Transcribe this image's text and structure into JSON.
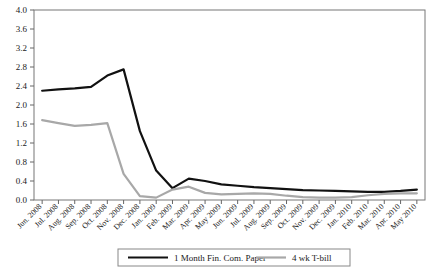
{
  "chart_data": {
    "type": "line",
    "title": "",
    "subtitle": "",
    "xlabel": "",
    "ylabel": "",
    "ylim": [
      0.0,
      4.0
    ],
    "ytick_step": 0.4,
    "grid": false,
    "legend_position": "bottom",
    "yticks": [
      "0.0",
      "0.4",
      "0.8",
      "1.2",
      "1.6",
      "2.0",
      "2.4",
      "2.8",
      "3.2",
      "3.6",
      "4.0"
    ],
    "ytick_values": [
      0.0,
      0.4,
      0.8,
      1.2,
      1.6,
      2.0,
      2.4,
      2.8,
      3.2,
      3.6,
      4.0
    ],
    "categories": [
      "Jun. 2008",
      "Jul. 2008",
      "Aug. 2008",
      "Sep. 2008",
      "Oct. 2008",
      "Nov. 2008",
      "Dec. 2008",
      "Jan. 2009",
      "Feb. 2009",
      "Mar. 2009",
      "Apr. 2009",
      "May 2009",
      "Jun. 2009",
      "Jul. 2009",
      "Aug. 2009",
      "Sep. 2009",
      "Oct. 2009",
      "Nov. 2009",
      "Dec. 2009",
      "Jan. 2010",
      "Feb. 2010",
      "Mar. 2010",
      "Apr. 2010",
      "May 2010"
    ],
    "series": [
      {
        "name": "1 Month Fin. Com. Paper",
        "color": "#111111",
        "width": 2.2,
        "values": [
          2.3,
          2.33,
          2.35,
          2.38,
          2.62,
          2.75,
          1.45,
          0.62,
          0.25,
          0.45,
          0.4,
          0.33,
          0.3,
          0.27,
          0.25,
          0.23,
          0.21,
          0.2,
          0.19,
          0.18,
          0.17,
          0.17,
          0.19,
          0.22
        ]
      },
      {
        "name": "4 wk T-bill",
        "color": "#a8a8a8",
        "width": 2.2,
        "values": [
          1.68,
          1.62,
          1.56,
          1.58,
          1.62,
          0.55,
          0.08,
          0.05,
          0.22,
          0.28,
          0.15,
          0.12,
          0.13,
          0.14,
          0.13,
          0.09,
          0.06,
          0.05,
          0.05,
          0.06,
          0.1,
          0.13,
          0.14,
          0.14
        ]
      }
    ]
  },
  "legend": {
    "items": [
      {
        "label": "1 Month Fin. Com. Paper",
        "color": "#111111"
      },
      {
        "label": "4 wk T-bill",
        "color": "#a8a8a8"
      }
    ]
  }
}
